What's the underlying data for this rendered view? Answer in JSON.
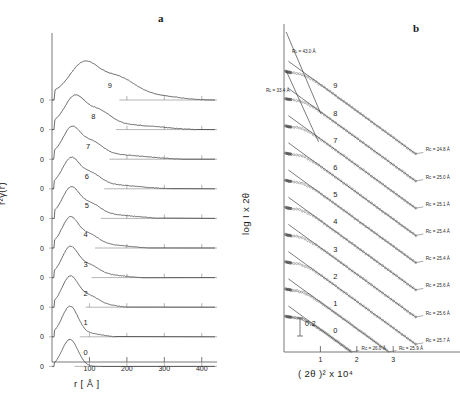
{
  "figure": {
    "panel_a_letter": "a",
    "panel_b_letter": "b"
  },
  "panel_a": {
    "ylabel": "r²γ(r)",
    "xlabel": "r [ Å ]",
    "xticks": [
      "100",
      "200",
      "300",
      "400"
    ],
    "xtick_values": [
      100,
      200,
      300,
      400
    ],
    "baseline_label": "0",
    "curve_labels": [
      "0",
      "1",
      "2",
      "3",
      "4",
      "5",
      "6",
      "7",
      "8",
      "9"
    ]
  },
  "panel_b": {
    "ylabel": "log I x 2θ",
    "xlabel": "( 2θ )² x 10⁴",
    "xticks": [
      "1",
      "2",
      "3"
    ],
    "xtick_values": [
      1,
      2,
      3
    ],
    "scalebar_label": "0.2",
    "scalebar_value": 0.2,
    "curve_labels": [
      "0",
      "1",
      "2",
      "3",
      "4",
      "5",
      "6",
      "7",
      "8",
      "9"
    ],
    "rc_annotations": [
      "Rᴄ = 26.0 Å",
      "Rᴄ = 25.9 Å",
      "Rᴄ = 25.7 Å",
      "Rᴄ = 25.6 Å",
      "Rᴄ = 25.6 Å",
      "Rᴄ = 25.4 Å",
      "Rᴄ = 25.4 Å",
      "Rᴄ = 25.1 Å",
      "Rᴄ = 25.0 Å",
      "Rᴄ = 24.8 Å"
    ],
    "rl_annotations": [
      "Rʟ = 43.0 Å",
      "Rʟ = 33.4 Å"
    ]
  },
  "chart_data": {
    "type": "line",
    "title": "",
    "charts": [
      {
        "type": "line",
        "panel": "a",
        "title": "",
        "xlabel": "r [ Å ]",
        "ylabel": "r²γ(r)",
        "xlim": [
          0,
          430
        ],
        "xticks": [
          100,
          200,
          300,
          400
        ],
        "grid": false,
        "legend": "none",
        "description": "Ten vertically offset correlation functions r²γ(r), labelled 0 (bottom) to 9 (top); each has its own zero baseline marked 0.",
        "series": [
          {
            "name": "0",
            "peak_r": 48,
            "peak_height": 1.0,
            "tail_end_r": 130
          },
          {
            "name": "1",
            "peak_r": 48,
            "peak_height": 1.0,
            "tail_end_r": 165
          },
          {
            "name": "2",
            "peak_r": 48,
            "peak_height": 0.97,
            "tail_end_r": 200
          },
          {
            "name": "3",
            "peak_r": 48,
            "peak_height": 0.95,
            "tail_end_r": 235
          },
          {
            "name": "4",
            "peak_r": 48,
            "peak_height": 0.93,
            "tail_end_r": 255
          },
          {
            "name": "5",
            "peak_r": 50,
            "peak_height": 0.92,
            "tail_end_r": 290
          },
          {
            "name": "6",
            "peak_r": 50,
            "peak_height": 0.9,
            "tail_end_r": 310
          },
          {
            "name": "7",
            "peak_r": 52,
            "peak_height": 0.92,
            "tail_end_r": 340
          },
          {
            "name": "8",
            "peak_r": 60,
            "peak_height": 0.95,
            "tail_end_r": 380
          },
          {
            "name": "9",
            "peak_r": 85,
            "peak_height": 1.05,
            "tail_end_r": 400
          }
        ]
      },
      {
        "type": "scatter",
        "panel": "b",
        "title": "",
        "xlabel": "( 2θ )² x 10⁴",
        "ylabel": "log I x 2θ",
        "xlim": [
          0,
          3.9
        ],
        "xticks": [
          1,
          2,
          3
        ],
        "grid": false,
        "legend": "none",
        "description": "Ten vertically offset Guinier plots of log(I·2θ) vs (2θ)²×10⁴, labelled 0 (bottom) to 9 (top). Open-circle data points with straight fitted lines; cross-section radii Rᴄ annotated at the right end of each fit. Two steeper lines at top give Rʟ values.",
        "series": [
          {
            "name": "0",
            "Rc": 26.0,
            "unit": "Å"
          },
          {
            "name": "1",
            "Rc": 25.9,
            "unit": "Å"
          },
          {
            "name": "2",
            "Rc": 25.7,
            "unit": "Å"
          },
          {
            "name": "3",
            "Rc": 25.6,
            "unit": "Å"
          },
          {
            "name": "4",
            "Rc": 25.6,
            "unit": "Å"
          },
          {
            "name": "5",
            "Rc": 25.4,
            "unit": "Å"
          },
          {
            "name": "6",
            "Rc": 25.4,
            "unit": "Å"
          },
          {
            "name": "7",
            "Rc": 25.1,
            "unit": "Å"
          },
          {
            "name": "8",
            "Rc": 25.0,
            "unit": "Å"
          },
          {
            "name": "9",
            "Rc": 24.8,
            "unit": "Å"
          }
        ],
        "extra_lines": [
          {
            "name": "RL-upper",
            "RL": 43.0,
            "unit": "Å"
          },
          {
            "name": "RL-lower",
            "RL": 33.4,
            "unit": "Å"
          }
        ],
        "scalebar": {
          "label": "0.2",
          "value": 0.2
        }
      }
    ]
  }
}
